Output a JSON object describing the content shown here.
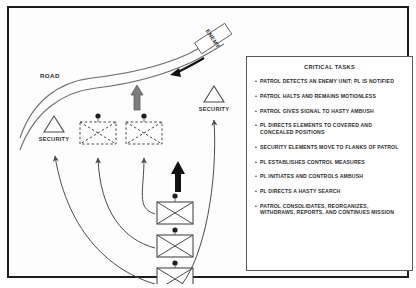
{
  "diagram": {
    "labels": {
      "road": "ROAD",
      "enemy": "ENEMY",
      "security_left": "SECURITY",
      "security_right": "SECURITY"
    },
    "icons": {
      "enemy_arrow": "enemy-direction-arrow",
      "gray_arrow": "patrol-signal-arrow",
      "black_arrow": "patrol-movement-arrow",
      "security_triangle": "security-element-triangle",
      "infantry_unit": "infantry-unit-symbol",
      "ambush_position": "dashed-ambush-position"
    },
    "counts": {
      "infantry_units": 3,
      "ambush_positions": 2,
      "security_triangles": 2
    },
    "colors": {
      "line": "#4a4a4a",
      "gray_arrow": "#808080",
      "black_arrow": "#111111",
      "frame": "#1c1c1c"
    }
  },
  "tasks": {
    "title": "CRITICAL TASKS",
    "bullet": "•",
    "items": [
      "PATROL DETECTS AN ENEMY UNIT; PL IS NOTIFIED",
      "PATROL HALTS AND REMAINS MOTIONLESS",
      "PATROL GIVES SIGNAL TO HASTY AMBUSH",
      "PL DIRECTS ELEMENTS TO COVERED AND CONCEALED POSITIONS",
      "SECURITY ELEMENTS MOVE TO FLANKS OF PATROL",
      "PL ESTABLISHES CONTROL MEASURES",
      "PL INITIATES AND CONTROLS AMBUSH",
      "PL DIRECTS A HASTY SEARCH",
      "PATROL CONSOLIDATES, REORGANIZES, WITHDRAWS, REPORTS, AND CONTINUES MISSION"
    ]
  }
}
